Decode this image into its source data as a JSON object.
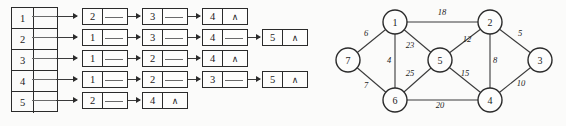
{
  "figure": {
    "left_panel": {
      "name": "adjacency-list",
      "headers": [
        {
          "key": "1"
        },
        {
          "key": "2"
        },
        {
          "key": "3"
        },
        {
          "key": "4"
        },
        {
          "key": "5"
        }
      ],
      "rows": [
        {
          "head": "1",
          "nodes": [
            "2",
            "3",
            "4"
          ],
          "terminator": "∧"
        },
        {
          "head": "2",
          "nodes": [
            "1",
            "3",
            "4",
            "5"
          ],
          "terminator": "∧"
        },
        {
          "head": "3",
          "nodes": [
            "1",
            "2",
            "4"
          ],
          "terminator": "∧"
        },
        {
          "head": "4",
          "nodes": [
            "1",
            "2",
            "3",
            "5"
          ],
          "terminator": "∧"
        },
        {
          "head": "5",
          "nodes": [
            "2",
            "4"
          ],
          "terminator": "∧"
        }
      ]
    },
    "right_panel": {
      "name": "weighted-graph",
      "vertices": [
        {
          "id": "1",
          "cx": 105,
          "cy": 22
        },
        {
          "id": "2",
          "cx": 200,
          "cy": 22
        },
        {
          "id": "3",
          "cx": 250,
          "cy": 60
        },
        {
          "id": "4",
          "cx": 200,
          "cy": 100
        },
        {
          "id": "5",
          "cx": 150,
          "cy": 60
        },
        {
          "id": "6",
          "cx": 105,
          "cy": 100
        },
        {
          "id": "7",
          "cx": 58,
          "cy": 60
        }
      ],
      "edges": [
        {
          "from": "1",
          "to": "2",
          "weight": "18",
          "lx": 152,
          "ly": 15
        },
        {
          "from": "1",
          "to": "7",
          "weight": "6",
          "lx": 76,
          "ly": 36
        },
        {
          "from": "1",
          "to": "6",
          "weight": "4",
          "lx": 99,
          "ly": 63
        },
        {
          "from": "1",
          "to": "5",
          "weight": "23",
          "lx": 120,
          "ly": 48
        },
        {
          "from": "2",
          "to": "5",
          "weight": "12",
          "lx": 177,
          "ly": 42
        },
        {
          "from": "2",
          "to": "3",
          "weight": "5",
          "lx": 230,
          "ly": 36
        },
        {
          "from": "2",
          "to": "4",
          "weight": "8",
          "lx": 205,
          "ly": 63
        },
        {
          "from": "3",
          "to": "4",
          "weight": "10",
          "lx": 231,
          "ly": 86
        },
        {
          "from": "5",
          "to": "6",
          "weight": "25",
          "lx": 120,
          "ly": 76
        },
        {
          "from": "5",
          "to": "4",
          "weight": "15",
          "lx": 175,
          "ly": 76
        },
        {
          "from": "6",
          "to": "4",
          "weight": "20",
          "lx": 150,
          "ly": 108
        },
        {
          "from": "6",
          "to": "7",
          "weight": "7",
          "lx": 76,
          "ly": 88
        }
      ]
    }
  },
  "style": {
    "ink": "#2b2b2b",
    "paper": "#fbfbfa"
  }
}
